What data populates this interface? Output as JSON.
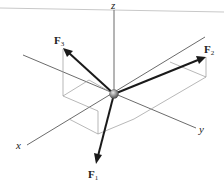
{
  "diagram": {
    "type": "3d-force-vectors",
    "axes": {
      "x_label": "x",
      "y_label": "y",
      "z_label": "z"
    },
    "forces": [
      {
        "name": "F",
        "subscript": "1",
        "direction": "down, toward +x side"
      },
      {
        "name": "F",
        "subscript": "2",
        "direction": "up-right, toward +y with +z"
      },
      {
        "name": "F",
        "subscript": "3",
        "direction": "up-left, toward -y with +z"
      }
    ],
    "origin": "particle (sphere) at origin",
    "colors": {
      "force": "#1a1a1a",
      "axis": "#5a5a5a",
      "guide": "#9a9a9a",
      "particle": "#8a8a8a"
    }
  }
}
